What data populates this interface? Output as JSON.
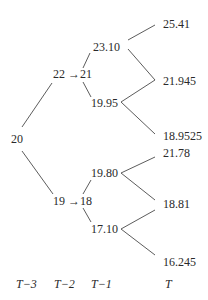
{
  "tree": {
    "root": "20",
    "level1": {
      "up": "22 →21",
      "down": "19 →18"
    },
    "level2": {
      "uu": "23.10",
      "ud": "19.95",
      "du": "19.80",
      "dd": "17.10"
    },
    "level3": {
      "uuu": "25.41",
      "uud": "21.945",
      "udd": "18.9525",
      "duu": "21.78",
      "dud": "18.81",
      "ddd": "16.245"
    }
  },
  "time_axis": {
    "t3": "T−3",
    "t2": "T−2",
    "t1": "T−1",
    "t0": "T"
  },
  "line_color": "#4a4a4a"
}
